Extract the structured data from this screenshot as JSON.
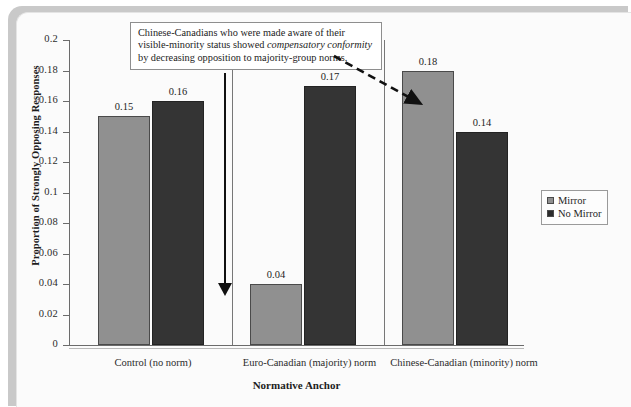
{
  "chart_data": {
    "type": "bar",
    "title": "",
    "xlabel": "Normative Anchor",
    "ylabel": "Proportion of Strongly Opposing Responses",
    "ylim": [
      0,
      0.2
    ],
    "grid": false,
    "legend_position": "right",
    "categories": [
      "Control (no norm)",
      "Euro-Canadian (majority) norm",
      "Chinese-Canadian (minority) norm"
    ],
    "series": [
      {
        "name": "Mirror",
        "color": "#909090",
        "values": [
          0.15,
          0.04,
          0.18
        ]
      },
      {
        "name": "No Mirror",
        "color": "#343434",
        "values": [
          0.16,
          0.17,
          0.14
        ]
      }
    ],
    "value_labels": [
      [
        "0.15",
        "0.16"
      ],
      [
        "0.04",
        "0.17"
      ],
      [
        "0.18",
        "0.14"
      ]
    ],
    "ticks": [
      "0.2",
      "0.18",
      "0.16",
      "0.14",
      "0.12",
      "0.1",
      "0.08",
      "0.06",
      "0.04",
      "0.02",
      "0"
    ],
    "tick_values": [
      0.2,
      0.18,
      0.16,
      0.14,
      0.12,
      0.1,
      0.08,
      0.06,
      0.04,
      0.02,
      0
    ],
    "annotations": [
      {
        "text_part1": "Chinese-Canadians who were made aware of their visible-minority status showed ",
        "text_italic": "compensatory conformity",
        "text_part2": " by decreasing opposition to majority-group norms.",
        "arrows": [
          "solid-down-to-euro-canadian-mirror-bar",
          "dashed-diagonal-to-chinese-canadian-mirror-bar"
        ]
      }
    ]
  }
}
